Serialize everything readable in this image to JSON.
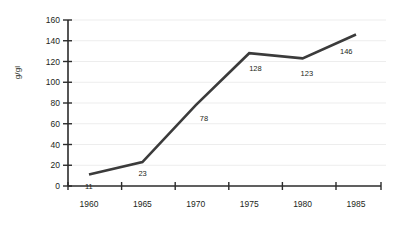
{
  "chart_data": {
    "type": "line",
    "title": "",
    "xlabel": "",
    "ylabel": "g/gl",
    "categories": [
      "1960",
      "1965",
      "1970",
      "1975",
      "1980",
      "1985"
    ],
    "x": [
      1960,
      1965,
      1970,
      1975,
      1980,
      1985
    ],
    "values": [
      11,
      23,
      78,
      128,
      123,
      146
    ],
    "point_labels": [
      "11",
      "23",
      "78",
      "128",
      "123",
      "146"
    ],
    "ylim": [
      0,
      160
    ],
    "yticks": [
      "0",
      "20",
      "40",
      "60",
      "80",
      "100",
      "120",
      "140",
      "160"
    ],
    "ytick_values": [
      0,
      20,
      40,
      60,
      80,
      100,
      120,
      140,
      160
    ],
    "xticks": [
      "1960",
      "1965",
      "1970",
      "1975",
      "1980",
      "1985"
    ],
    "grid": true,
    "grid_axis": "y",
    "legend": "none",
    "series": [
      {
        "name": "",
        "values": [
          11,
          23,
          78,
          128,
          123,
          146
        ]
      }
    ],
    "colors": {
      "line": "#3b3b3b",
      "grid": "#ededed",
      "axis": "#2b2b2b",
      "text": "#231f20",
      "background": "#ffffff"
    }
  }
}
